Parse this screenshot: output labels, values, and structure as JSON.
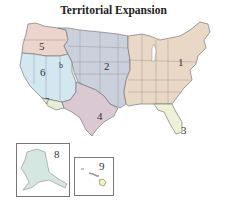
{
  "title": "Territorial Expansion",
  "regions": [
    {
      "id": "1",
      "label": "1",
      "color": "#ead8c6"
    },
    {
      "id": "2",
      "label": "2",
      "color": "#cbd0dd"
    },
    {
      "id": "3",
      "label": "3",
      "color": "#eff1d6"
    },
    {
      "id": "4",
      "label": "4",
      "color": "#dac9d2"
    },
    {
      "id": "5",
      "label": "5",
      "color": "#ecd3cc"
    },
    {
      "id": "6",
      "label": "6",
      "color": "#d3e7f0"
    },
    {
      "id": "6b",
      "label": "b",
      "color": "#d3e7f0"
    },
    {
      "id": "7",
      "label": "7",
      "color": "#e6edd6"
    },
    {
      "id": "8",
      "label": "8",
      "color": "#d5e7e1"
    },
    {
      "id": "9",
      "label": "9",
      "color": "#eef0d2"
    }
  ],
  "insets": [
    {
      "name": "alaska",
      "label": "8"
    },
    {
      "name": "hawaii",
      "label": "9"
    }
  ],
  "border_color": "#777777"
}
